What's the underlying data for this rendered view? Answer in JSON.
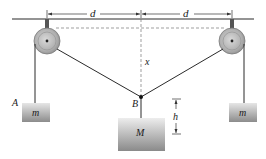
{
  "diagram": {
    "type": "pulley-system",
    "labels": {
      "d_left": "d",
      "d_right": "d",
      "x": "x",
      "h": "h",
      "A": "A",
      "B": "B",
      "mass_left": "m",
      "mass_center": "M",
      "mass_right": "m"
    },
    "colors": {
      "line": "#2a2a2a",
      "pulley_outer": "#a9a9a9",
      "pulley_inner": "#c8c8c8",
      "mass_top": "#e4e4e4",
      "mass_bottom": "#8f8f8f",
      "dashed": "#777777"
    }
  }
}
